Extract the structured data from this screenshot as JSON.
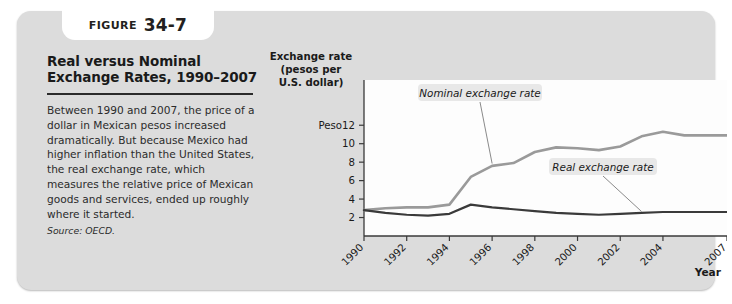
{
  "figure": {
    "badge_word": "FIGURE",
    "badge_number": "34-7",
    "title": "Real versus Nominal Exchange Rates, 1990–2007",
    "caption": "Between 1990 and 2007, the price of a dollar in Mexican pesos increased dramatically. But because Mexico had higher inflation than the United States, the real exchange rate, which measures the relative price of Mexican goods and services, ended up roughly where it started.",
    "source": "Source: OECD."
  },
  "chart_data": {
    "type": "line",
    "title": "Real versus Nominal Exchange Rates, 1990–2007",
    "ylabel": "Exchange rate (pesos per U.S. dollar)",
    "ylabel_lines": [
      "Exchange rate",
      "(pesos per",
      "U.S. dollar)"
    ],
    "xlabel": "Year",
    "y_unit_prefix": "Peso",
    "yticks": [
      2,
      4,
      6,
      8,
      10,
      12
    ],
    "ytick_labels": [
      "2",
      "4",
      "6",
      "8",
      "10",
      "Peso12"
    ],
    "ylim": [
      0,
      13
    ],
    "xticks": [
      1990,
      1992,
      1994,
      1996,
      1998,
      2000,
      2002,
      2004,
      2007
    ],
    "xtick_labels": [
      "1990",
      "1992",
      "1994",
      "1996",
      "1998",
      "2000",
      "2002",
      "2004",
      "2007"
    ],
    "xlim": [
      1990,
      2007
    ],
    "grid": false,
    "legend_position": "inline-annotations",
    "x": [
      1990,
      1991,
      1992,
      1993,
      1994,
      1995,
      1996,
      1997,
      1998,
      1999,
      2000,
      2001,
      2002,
      2003,
      2004,
      2005,
      2006,
      2007
    ],
    "series": [
      {
        "name": "Nominal exchange rate",
        "color": "#9a9a9a",
        "values": [
          2.8,
          3.0,
          3.1,
          3.1,
          3.4,
          6.4,
          7.6,
          7.9,
          9.1,
          9.6,
          9.5,
          9.3,
          9.7,
          10.8,
          11.3,
          10.9,
          10.9,
          10.9
        ]
      },
      {
        "name": "Real exchange rate",
        "color": "#3a3a3a",
        "values": [
          2.8,
          2.5,
          2.3,
          2.2,
          2.4,
          3.4,
          3.1,
          2.9,
          2.7,
          2.5,
          2.4,
          2.3,
          2.4,
          2.5,
          2.6,
          2.6,
          2.6,
          2.6
        ]
      }
    ],
    "annotations": [
      {
        "text": "Nominal exchange rate",
        "series": "Nominal exchange rate"
      },
      {
        "text": "Real exchange rate",
        "series": "Real exchange rate"
      }
    ]
  }
}
